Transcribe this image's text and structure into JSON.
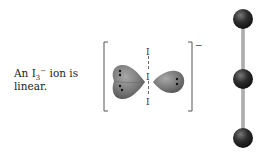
{
  "caption": {
    "prefix": "An I",
    "subscript": "3",
    "superscript": "−",
    "suffix": " ion is",
    "line2": "linear."
  },
  "lewis_structure": {
    "atom_labels": [
      "I",
      "I",
      "I"
    ],
    "charge": "−",
    "lone_pair_lobes": 2
  },
  "ball_and_stick": {
    "atoms": 3,
    "geometry": "linear"
  },
  "colors": {
    "lobe": "#7a7a7a",
    "ball": "#2b2b2b",
    "stick": "#9a9a9a",
    "bracket": "#555555"
  }
}
